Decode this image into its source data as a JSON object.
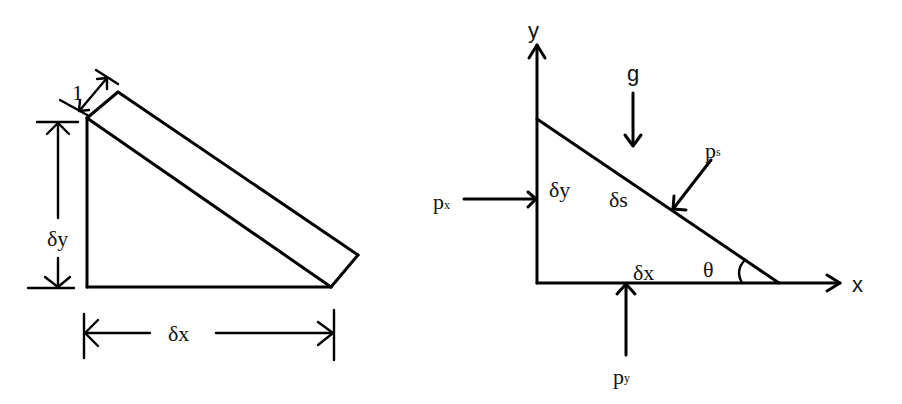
{
  "figure": {
    "background": "#ffffff",
    "stroke_color": "#000000",
    "left_panel": {
      "title": "Triangular fluid element with unit depth",
      "labels": {
        "depth": "1",
        "height": "δy",
        "width": "δx"
      }
    },
    "right_panel": {
      "title": "Forces on triangular fluid element",
      "axes": {
        "x_label": "x",
        "y_label": "y"
      },
      "labels": {
        "gravity": "g",
        "height": "δy",
        "hypotenuse": "δs",
        "base": "δx",
        "angle": "θ"
      },
      "pressures": [
        {
          "name": "px",
          "base": "p",
          "subscript": "x",
          "direction": "right",
          "acts_on": "vertical face"
        },
        {
          "name": "py",
          "base": "p",
          "subscript": "y",
          "direction": "up",
          "acts_on": "horizontal face"
        },
        {
          "name": "ps",
          "base": "p",
          "subscript": "s",
          "direction": "normal-inward",
          "acts_on": "inclined face"
        }
      ]
    }
  }
}
